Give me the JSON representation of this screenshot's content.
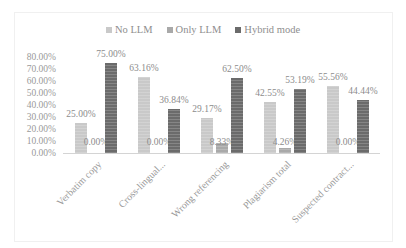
{
  "chart_data": {
    "type": "bar",
    "title": "",
    "xlabel": "",
    "ylabel": "",
    "ylim": [
      0,
      80
    ],
    "y_ticks": [
      "0.00%",
      "10.00%",
      "20.00%",
      "30.00%",
      "40.00%",
      "50.00%",
      "60.00%",
      "70.00%",
      "80.00%"
    ],
    "grid": false,
    "legend_position": "top",
    "categories": [
      "Verbatim copy",
      "Cross-lingual...",
      "Wrong referencing",
      "Plagiarism total",
      "Suspected contract..."
    ],
    "series": [
      {
        "name": "No LLM",
        "color": "#c9c9c9",
        "values": [
          25.0,
          63.16,
          29.17,
          42.55,
          55.56
        ],
        "labels": [
          "25.00%",
          "63.16%",
          "29.17%",
          "42.55%",
          "55.56%"
        ]
      },
      {
        "name": "Only LLM",
        "color": "#a9a9a9",
        "values": [
          0.0,
          0.0,
          8.33,
          4.26,
          0.0
        ],
        "labels": [
          "0.00%",
          "0.00%",
          "8.33%",
          "4.26%",
          "0.00%"
        ]
      },
      {
        "name": "Hybrid mode",
        "color": "#6b6b6b",
        "values": [
          75.0,
          36.84,
          62.5,
          53.19,
          44.44
        ],
        "labels": [
          "75.00%",
          "36.84%",
          "62.50%",
          "53.19%",
          "44.44%"
        ]
      }
    ]
  },
  "legend": {
    "items": [
      {
        "label": "No LLM",
        "color": "#c9c9c9"
      },
      {
        "label": "Only LLM",
        "color": "#a9a9a9"
      },
      {
        "label": "Hybrid mode",
        "color": "#6b6b6b"
      }
    ]
  }
}
